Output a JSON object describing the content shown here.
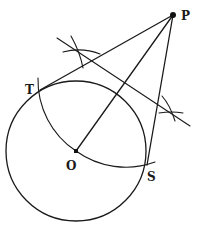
{
  "diagram": {
    "labels": {
      "P": "P",
      "T": "T",
      "O": "O",
      "S": "S"
    },
    "points": {
      "P": [
        173,
        15
      ],
      "O": [
        76,
        151
      ],
      "T": [
        40,
        90
      ],
      "S": [
        147,
        165
      ],
      "M": [
        125,
        83
      ]
    },
    "circle": {
      "center": "O",
      "radius": 70
    },
    "construction_circle": {
      "center": "M",
      "note": "circle on diameter OP, meeting the given circle at T and S"
    },
    "segments": [
      {
        "name": "tangent-PT",
        "from": "P",
        "to": "T"
      },
      {
        "name": "tangent-PS",
        "from": "P",
        "to": "S"
      },
      {
        "name": "line-OP",
        "from": "O",
        "to": "P"
      }
    ],
    "colors": {
      "ink": "#1a1a1a",
      "background": "#ffffff"
    }
  }
}
